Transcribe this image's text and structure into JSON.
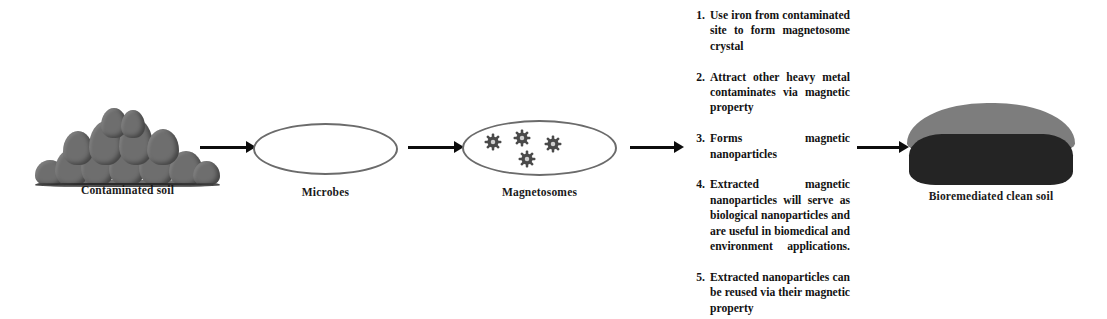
{
  "diagram": {
    "type": "process-flow",
    "accent_colors": {
      "soil_grey": "#6e6e6e",
      "clean_soil_light": "#7d7d7d",
      "clean_soil_dark": "#242424",
      "cell_outline": "#6b6b6b",
      "arrow": "#0d0d0d",
      "text": "#121212",
      "background": "#ffffff"
    }
  },
  "stages": [
    {
      "id": "contaminated-soil",
      "caption": "Contaminated soil",
      "icon": "soil-mound-icon"
    },
    {
      "id": "microbes",
      "caption": "Microbes",
      "icon": "cell-ellipse-icon"
    },
    {
      "id": "magnetosomes",
      "caption": "Magnetosomes",
      "icon": "cell-with-particles-icon",
      "particle_count": 4
    },
    {
      "id": "bioremediated-soil",
      "caption": "Bioremediated clean soil",
      "icon": "clean-soil-mound-icon"
    }
  ],
  "arrows": [
    {
      "id": "arrow-1",
      "from": "contaminated-soil",
      "to": "microbes"
    },
    {
      "id": "arrow-2",
      "from": "microbes",
      "to": "magnetosomes"
    },
    {
      "id": "arrow-3",
      "from": "magnetosomes",
      "to": "process-steps"
    },
    {
      "id": "arrow-4",
      "from": "process-steps",
      "to": "bioremediated-soil"
    }
  ],
  "process_steps": [
    {
      "number": "1.",
      "text": "Use iron from contaminated site to form magnetosome crystal"
    },
    {
      "number": "2.",
      "text": "Attract other heavy metal contaminates via magnetic property"
    },
    {
      "number": "3.",
      "text": "Forms magnetic nanoparticles"
    },
    {
      "number": "4.",
      "text": "Extracted magnetic nanoparticles will serve as biological nanoparticles and are useful in biomedical and environment applications."
    },
    {
      "number": "5.",
      "text": "Extracted nanoparticles can be reused via their magnetic property"
    }
  ]
}
